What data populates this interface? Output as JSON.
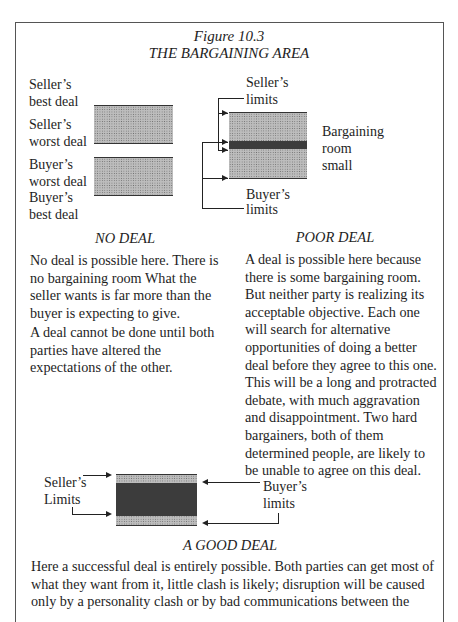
{
  "figure": {
    "number": "Figure 10.3",
    "title": "THE BARGAINING AREA"
  },
  "no_deal": {
    "labels": {
      "seller_best_1": "Seller’s",
      "seller_best_2": "best deal",
      "seller_worst_1": "Seller’s",
      "seller_worst_2": "worst deal",
      "buyer_worst_1": "Buyer’s",
      "buyer_worst_2": "worst deal",
      "buyer_best_1": "Buyer’s",
      "buyer_best_2": "best deal"
    },
    "caption": "NO DEAL",
    "paragraphs": [
      "No deal is possible here. There is no bargaining room  What the seller wants is far more than the buyer is expecting to give.",
      "A deal cannot be done until both parties have altered the expectations of the other."
    ]
  },
  "poor_deal": {
    "labels": {
      "seller_limits_1": "Seller’s",
      "seller_limits_2": "limits",
      "room_1": "Bargaining",
      "room_2": "room",
      "room_3": "small",
      "buyer_limits_1": "Buyer’s",
      "buyer_limits_2": "limits"
    },
    "caption": "POOR DEAL",
    "paragraph": "A deal is possible here because there is some bargaining room. But neither party is realizing its acceptable objective. Each one will search for alternative opportunities of doing a better deal before they agree to this one. This will be a long and protracted debate, with much aggravation and disappointment. Two hard bargainers, both of them determined people, are likely to be unable to agree on this deal."
  },
  "good_deal": {
    "labels": {
      "seller_limits_1": "Seller’s",
      "seller_limits_2": "Limits",
      "buyer_limits_1": "Buyer’s",
      "buyer_limits_2": "limits"
    },
    "caption": "A GOOD DEAL",
    "paragraph": "Here a successful deal is entirely possible. Both parties can get most of what they want from it, little clash is likely; disruption will be caused only by a personality clash or by bad communications between the"
  }
}
